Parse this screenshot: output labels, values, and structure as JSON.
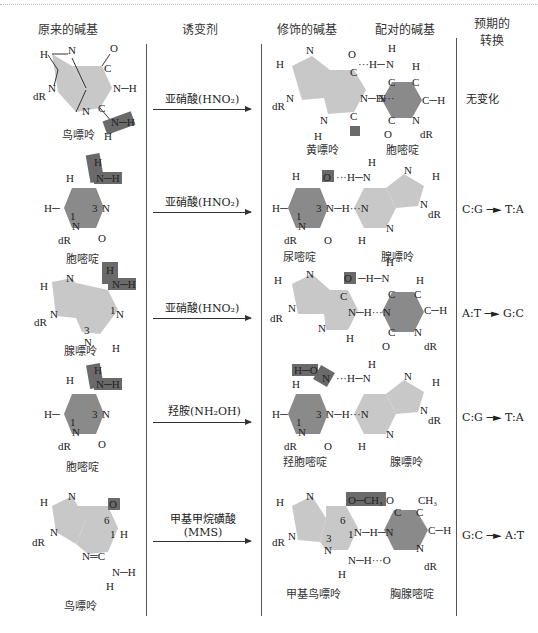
{
  "headers": {
    "original_base": "原来的碱基",
    "mutagen": "诱变剂",
    "modified_base": "修饰的碱基",
    "paired_base": "配对的碱基",
    "expected_transition_line1": "预期的",
    "expected_transition_line2": "转换"
  },
  "rows": [
    {
      "original_base": "鸟嘌呤",
      "mutagen": "亚硝酸(HNO₂)",
      "modified_base": "黄嘌呤",
      "paired_base": "胞嘧啶",
      "transition": "无变化"
    },
    {
      "original_base": "胞嘧啶",
      "mutagen": "亚硝酸(HNO₂)",
      "modified_base": "尿嘧啶",
      "paired_base": "腺嘌呤",
      "transition": "C:G ─► T:A"
    },
    {
      "original_base": "腺嘌呤",
      "mutagen": "亚硝酸(HNO₂)",
      "modified_base": "",
      "paired_base": "",
      "transition": "A:T ─► G:C"
    },
    {
      "original_base": "胞嘧啶",
      "mutagen": "羟胺(NH₂OH)",
      "modified_base": "羟胞嘧啶",
      "paired_base": "腺嘌呤",
      "transition": "C:G ─► T:A"
    },
    {
      "original_base": "鸟嘌呤",
      "mutagen_line1": "甲基甲烷磺酸",
      "mutagen_line2": "(MMS)",
      "modified_base": "甲基鸟嘌呤",
      "paired_base": "胸腺嘧啶",
      "transition": "G:C ─► A:T"
    }
  ],
  "atoms": {
    "H": "H",
    "N": "N",
    "O": "O",
    "C": "C",
    "dR": "dR",
    "CH3": "CH₃",
    "NH": "N─H",
    "OCH3": "O─CH₃",
    "HO": "H─O",
    "one": "1",
    "three": "3",
    "six": "6"
  },
  "colors": {
    "purine_fill": "#c8c8c8",
    "pyrimidine_fill": "#8a8a8a",
    "highlight_fill": "#6a6a6a",
    "line": "#333333"
  }
}
